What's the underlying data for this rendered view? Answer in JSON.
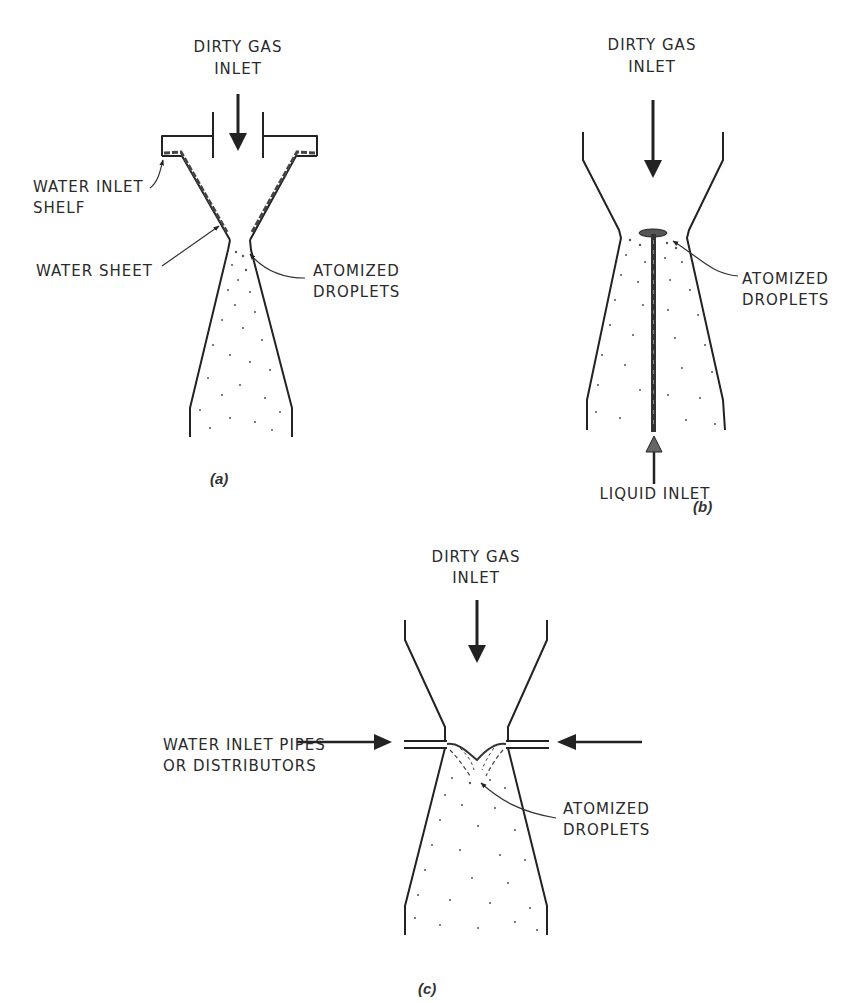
{
  "figure": {
    "panels": [
      {
        "id": "a",
        "caption": "(a)",
        "gas_inlet_label_line1": "DIRTY GAS",
        "gas_inlet_label_line2": "INLET",
        "callouts": [
          {
            "line1": "WATER INLET",
            "line2": "SHELF"
          },
          {
            "line1": "WATER SHEET"
          },
          {
            "line1": "ATOMIZED",
            "line2": "DROPLETS"
          }
        ]
      },
      {
        "id": "b",
        "caption": "(b)",
        "gas_inlet_label_line1": "DIRTY GAS",
        "gas_inlet_label_line2": "INLET",
        "liquid_inlet_label": "LIQUID INLET",
        "callouts": [
          {
            "line1": "ATOMIZED",
            "line2": "DROPLETS"
          }
        ]
      },
      {
        "id": "c",
        "caption": "(c)",
        "gas_inlet_label_line1": "DIRTY GAS",
        "gas_inlet_label_line2": "INLET",
        "callouts": [
          {
            "line1": "WATER INLET PIPES",
            "line2": "OR DISTRIBUTORS"
          },
          {
            "line1": "ATOMIZED",
            "line2": "DROPLETS"
          }
        ]
      }
    ],
    "colors": {
      "line": "#222222",
      "text": "#2a2a2a",
      "background": "#ffffff",
      "liquid_arrow": "#666666"
    }
  }
}
